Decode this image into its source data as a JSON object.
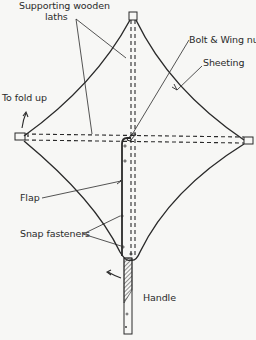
{
  "diagram": {
    "labels": {
      "supporting_laths_line1": "Supporting wooden",
      "supporting_laths_line2": "laths",
      "bolt_wing_nut": "Bolt & Wing nut",
      "sheeting": "Sheeting",
      "to_fold_up": "To fold up",
      "flap": "Flap",
      "snap_fasteners": "Snap fasteners",
      "handle": "Handle"
    },
    "colors": {
      "ink": "#2a2a2a",
      "background": "#f7f7f5"
    }
  }
}
